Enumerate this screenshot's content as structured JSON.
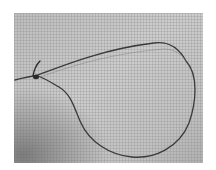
{
  "image": {
    "subject": "wire loop with twisted knot on grid paper",
    "description": "Grayscale photograph of a thin wire formed into a teardrop-shaped loop, twisted at the left end, lying on a fine gridded surface",
    "colors": {
      "background_light": "#cfcfcf",
      "background_dark": "#8c8c8c",
      "grid_line": "#9a9a9a",
      "wire": "#3a3a3a"
    }
  }
}
